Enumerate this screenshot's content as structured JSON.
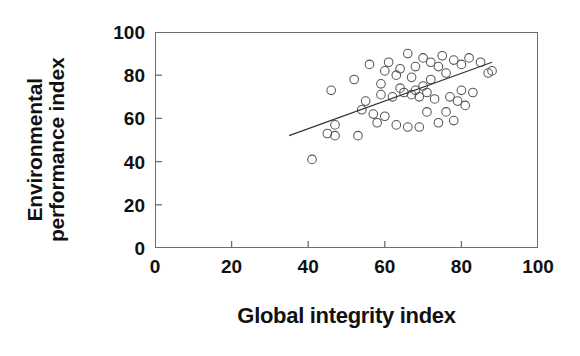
{
  "chart_data": {
    "type": "scatter",
    "title": "",
    "xlabel": "Global integrity index",
    "ylabel": "Environmental performance index",
    "ylabel_lines": [
      "Environmental",
      "performance index"
    ],
    "xlim": [
      0,
      100
    ],
    "ylim": [
      0,
      100
    ],
    "xticks": [
      0,
      20,
      40,
      60,
      80,
      100
    ],
    "yticks": [
      0,
      20,
      40,
      60,
      80,
      100
    ],
    "grid": false,
    "legend": null,
    "marker_style": "open-circle",
    "points": [
      {
        "x": 41,
        "y": 41
      },
      {
        "x": 45,
        "y": 53
      },
      {
        "x": 46,
        "y": 73
      },
      {
        "x": 47,
        "y": 52
      },
      {
        "x": 47,
        "y": 57
      },
      {
        "x": 52,
        "y": 78
      },
      {
        "x": 53,
        "y": 52
      },
      {
        "x": 54,
        "y": 64
      },
      {
        "x": 55,
        "y": 68
      },
      {
        "x": 56,
        "y": 85
      },
      {
        "x": 57,
        "y": 62
      },
      {
        "x": 58,
        "y": 58
      },
      {
        "x": 59,
        "y": 76
      },
      {
        "x": 59,
        "y": 71
      },
      {
        "x": 60,
        "y": 82
      },
      {
        "x": 60,
        "y": 61
      },
      {
        "x": 61,
        "y": 86
      },
      {
        "x": 62,
        "y": 70
      },
      {
        "x": 63,
        "y": 57
      },
      {
        "x": 63,
        "y": 80
      },
      {
        "x": 64,
        "y": 74
      },
      {
        "x": 64,
        "y": 83
      },
      {
        "x": 65,
        "y": 72
      },
      {
        "x": 66,
        "y": 56
      },
      {
        "x": 66,
        "y": 90
      },
      {
        "x": 67,
        "y": 71
      },
      {
        "x": 67,
        "y": 79
      },
      {
        "x": 68,
        "y": 73
      },
      {
        "x": 68,
        "y": 84
      },
      {
        "x": 69,
        "y": 56
      },
      {
        "x": 69,
        "y": 70
      },
      {
        "x": 70,
        "y": 75
      },
      {
        "x": 70,
        "y": 88
      },
      {
        "x": 71,
        "y": 63
      },
      {
        "x": 71,
        "y": 72
      },
      {
        "x": 72,
        "y": 86
      },
      {
        "x": 72,
        "y": 78
      },
      {
        "x": 73,
        "y": 69
      },
      {
        "x": 74,
        "y": 58
      },
      {
        "x": 74,
        "y": 84
      },
      {
        "x": 75,
        "y": 89
      },
      {
        "x": 76,
        "y": 63
      },
      {
        "x": 76,
        "y": 81
      },
      {
        "x": 77,
        "y": 70
      },
      {
        "x": 78,
        "y": 87
      },
      {
        "x": 78,
        "y": 59
      },
      {
        "x": 79,
        "y": 68
      },
      {
        "x": 80,
        "y": 85
      },
      {
        "x": 80,
        "y": 73
      },
      {
        "x": 81,
        "y": 66
      },
      {
        "x": 82,
        "y": 88
      },
      {
        "x": 83,
        "y": 72
      },
      {
        "x": 85,
        "y": 86
      },
      {
        "x": 87,
        "y": 81
      },
      {
        "x": 88,
        "y": 82
      }
    ],
    "trendline": {
      "x_start": 35,
      "y_start": 52,
      "x_end": 88,
      "y_end": 86,
      "description": "positive linear fit"
    },
    "colors": {
      "marker_stroke": "#555555",
      "trendline": "#333333",
      "axis": "#6e6e6e",
      "text": "#111111",
      "background": "#ffffff"
    }
  }
}
